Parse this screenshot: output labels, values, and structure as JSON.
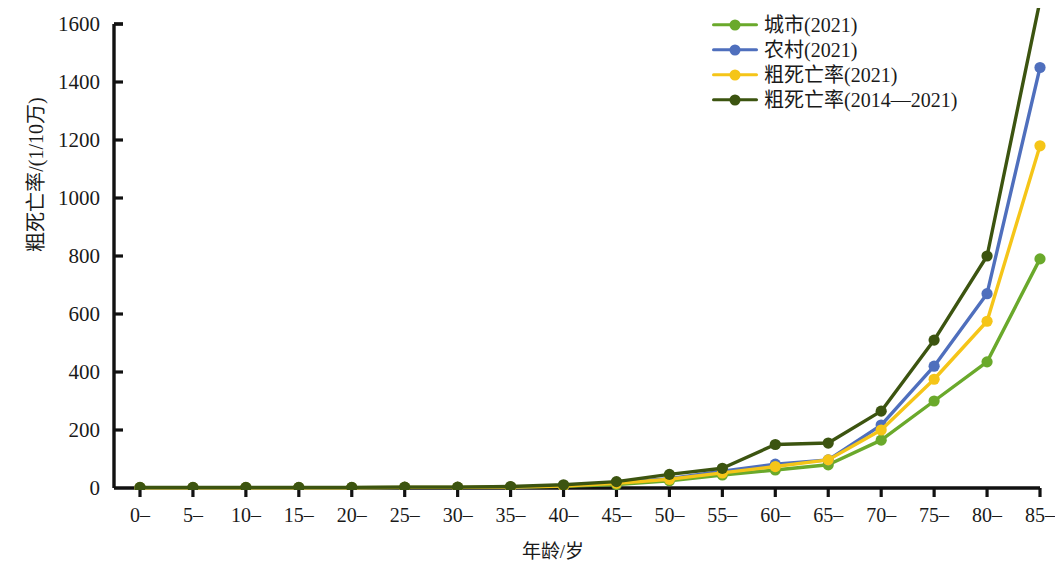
{
  "chart_data": {
    "type": "line",
    "title": "",
    "xlabel": "年龄/岁",
    "ylabel": "粗死亡率/(1/10万)",
    "categories": [
      "0–",
      "5–",
      "10–",
      "15–",
      "20–",
      "25–",
      "30–",
      "35–",
      "40–",
      "45–",
      "50–",
      "55–",
      "60–",
      "65–",
      "70–",
      "75–",
      "80–",
      "85–"
    ],
    "xlim": [
      0,
      17
    ],
    "ylim": [
      0,
      1600
    ],
    "yticks": [
      0,
      200,
      400,
      600,
      800,
      1000,
      1200,
      1400,
      1600
    ],
    "grid": false,
    "legend_position": "top-right",
    "clipped_note": "粗死亡率(2014—2021) 在 85– 组超出绘图区上界",
    "series": [
      {
        "name": "城市(2021)",
        "color": "#6aa92b",
        "values": [
          1,
          1,
          1,
          1,
          1,
          2,
          2,
          3,
          6,
          12,
          25,
          45,
          62,
          80,
          165,
          300,
          435,
          790
        ]
      },
      {
        "name": "农村(2021)",
        "color": "#4f6fbd",
        "values": [
          1,
          1,
          1,
          1,
          1,
          2,
          2,
          3,
          8,
          18,
          32,
          58,
          82,
          97,
          217,
          420,
          670,
          1450
        ]
      },
      {
        "name": "粗死亡率(2021)",
        "color": "#f5c518",
        "values": [
          1,
          1,
          1,
          1,
          1,
          2,
          2,
          3,
          7,
          16,
          30,
          52,
          74,
          97,
          200,
          375,
          575,
          1180
        ]
      },
      {
        "name": "粗死亡率(2014—2021)",
        "color": "#3c5410",
        "values": [
          2,
          2,
          2,
          2,
          2,
          3,
          3,
          5,
          11,
          22,
          47,
          68,
          150,
          155,
          265,
          510,
          800,
          1680
        ]
      }
    ]
  },
  "legend": {
    "items": [
      {
        "label": "城市(2021)"
      },
      {
        "label": "农村(2021)"
      },
      {
        "label": "粗死亡率(2021)"
      },
      {
        "label": "粗死亡率(2014—2021)"
      }
    ]
  },
  "axes": {
    "y_title": "粗死亡率/(1/10万)",
    "x_title": "年龄/岁"
  }
}
